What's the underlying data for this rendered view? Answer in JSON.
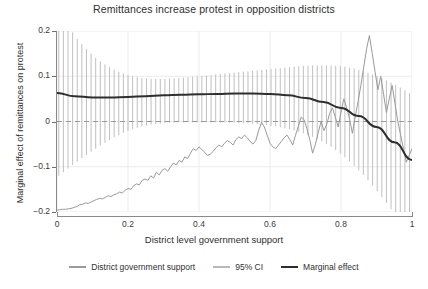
{
  "chart_data": {
    "type": "line",
    "title": "Remittances increase protest in opposition districts",
    "xlabel": "District level government support",
    "ylabel": "Marginal effect of remittances on protest",
    "xlim": [
      0,
      1
    ],
    "ylim": [
      -0.2,
      0.2
    ],
    "xticks": [
      "0",
      "0.2",
      "0.4",
      "0.6",
      "0.8",
      "1"
    ],
    "xtick_values": [
      0,
      0.2,
      0.4,
      0.6,
      0.8,
      1
    ],
    "yticks": [
      "0.2",
      "0.1",
      "0",
      "-0.1",
      "-0.2"
    ],
    "ytick_values": [
      0.2,
      0.1,
      0,
      -0.1,
      -0.2
    ],
    "grid": true,
    "legend_position": "bottom",
    "zero_reference_line": 0,
    "colors": {
      "support_line": "#9a9a9a",
      "ci_bars": "#b9b9b9",
      "marginal_effect": "#2e2e2e",
      "grid": "#ebebeb",
      "zero_line": "#9a9a9a",
      "axis": "#8a8a8a",
      "text": "#2f2f2f",
      "background": "#ffffff"
    },
    "series": [
      {
        "name": "Marginal effect",
        "style": "solid-thick-dark",
        "x": [
          0.0,
          0.05,
          0.1,
          0.15,
          0.2,
          0.25,
          0.3,
          0.35,
          0.4,
          0.45,
          0.5,
          0.55,
          0.6,
          0.65,
          0.7,
          0.75,
          0.8,
          0.85,
          0.9,
          0.95,
          1.0
        ],
        "values": [
          0.063,
          0.056,
          0.053,
          0.053,
          0.054,
          0.056,
          0.058,
          0.059,
          0.06,
          0.061,
          0.062,
          0.062,
          0.061,
          0.058,
          0.052,
          0.043,
          0.03,
          0.012,
          -0.012,
          -0.046,
          -0.085
        ]
      },
      {
        "name": "95% CI",
        "style": "vertical-bars",
        "x": [
          0.005,
          0.018,
          0.031,
          0.044,
          0.057,
          0.07,
          0.083,
          0.096,
          0.109,
          0.122,
          0.135,
          0.148,
          0.161,
          0.174,
          0.187,
          0.2,
          0.213,
          0.226,
          0.239,
          0.252,
          0.265,
          0.278,
          0.291,
          0.304,
          0.317,
          0.33,
          0.343,
          0.356,
          0.369,
          0.382,
          0.395,
          0.408,
          0.421,
          0.434,
          0.447,
          0.46,
          0.473,
          0.486,
          0.499,
          0.512,
          0.525,
          0.538,
          0.551,
          0.564,
          0.577,
          0.59,
          0.603,
          0.616,
          0.629,
          0.642,
          0.655,
          0.668,
          0.681,
          0.694,
          0.707,
          0.72,
          0.733,
          0.746,
          0.759,
          0.772,
          0.785,
          0.798,
          0.811,
          0.824,
          0.837,
          0.85,
          0.863,
          0.876,
          0.889,
          0.902,
          0.915,
          0.928,
          0.941,
          0.954,
          0.967,
          0.98,
          0.993
        ],
        "lower": [
          -0.12,
          -0.112,
          -0.104,
          -0.096,
          -0.089,
          -0.081,
          -0.074,
          -0.067,
          -0.06,
          -0.053,
          -0.047,
          -0.041,
          -0.035,
          -0.03,
          -0.025,
          -0.021,
          -0.017,
          -0.014,
          -0.011,
          -0.009,
          -0.007,
          -0.006,
          -0.005,
          -0.004,
          -0.003,
          -0.003,
          -0.002,
          -0.002,
          -0.002,
          -0.002,
          -0.002,
          -0.002,
          -0.002,
          -0.002,
          -0.002,
          -0.002,
          -0.002,
          -0.002,
          -0.003,
          -0.003,
          -0.004,
          -0.004,
          -0.005,
          -0.006,
          -0.007,
          -0.008,
          -0.01,
          -0.011,
          -0.013,
          -0.015,
          -0.017,
          -0.02,
          -0.023,
          -0.026,
          -0.03,
          -0.034,
          -0.039,
          -0.044,
          -0.05,
          -0.056,
          -0.063,
          -0.071,
          -0.079,
          -0.088,
          -0.098,
          -0.108,
          -0.118,
          -0.13,
          -0.142,
          -0.154,
          -0.167,
          -0.18,
          -0.194,
          -0.208,
          -0.222,
          -0.237,
          -0.252
        ],
        "upper": [
          0.246,
          0.228,
          0.212,
          0.197,
          0.183,
          0.171,
          0.16,
          0.15,
          0.141,
          0.133,
          0.126,
          0.12,
          0.115,
          0.11,
          0.106,
          0.103,
          0.1,
          0.098,
          0.096,
          0.095,
          0.094,
          0.094,
          0.094,
          0.094,
          0.095,
          0.095,
          0.096,
          0.097,
          0.098,
          0.099,
          0.1,
          0.101,
          0.102,
          0.103,
          0.104,
          0.105,
          0.106,
          0.107,
          0.108,
          0.109,
          0.11,
          0.111,
          0.112,
          0.113,
          0.114,
          0.115,
          0.116,
          0.117,
          0.118,
          0.119,
          0.12,
          0.121,
          0.122,
          0.123,
          0.123,
          0.124,
          0.124,
          0.124,
          0.124,
          0.124,
          0.123,
          0.122,
          0.121,
          0.119,
          0.117,
          0.114,
          0.111,
          0.108,
          0.104,
          0.1,
          0.096,
          0.091,
          0.086,
          0.081,
          0.075,
          0.069,
          0.063
        ]
      },
      {
        "name": "District government support",
        "style": "solid-thin-gray",
        "x": [
          0.0,
          0.008,
          0.016,
          0.024,
          0.032,
          0.04,
          0.048,
          0.056,
          0.064,
          0.072,
          0.08,
          0.088,
          0.096,
          0.104,
          0.112,
          0.12,
          0.128,
          0.136,
          0.144,
          0.152,
          0.16,
          0.168,
          0.176,
          0.184,
          0.192,
          0.2,
          0.208,
          0.216,
          0.224,
          0.232,
          0.24,
          0.248,
          0.256,
          0.264,
          0.272,
          0.28,
          0.288,
          0.296,
          0.304,
          0.312,
          0.32,
          0.328,
          0.336,
          0.344,
          0.352,
          0.36,
          0.368,
          0.376,
          0.384,
          0.392,
          0.4,
          0.408,
          0.416,
          0.424,
          0.432,
          0.44,
          0.448,
          0.456,
          0.464,
          0.472,
          0.48,
          0.488,
          0.496,
          0.504,
          0.512,
          0.52,
          0.528,
          0.536,
          0.544,
          0.552,
          0.56,
          0.568,
          0.576,
          0.584,
          0.592,
          0.6,
          0.608,
          0.616,
          0.624,
          0.632,
          0.64,
          0.648,
          0.656,
          0.664,
          0.672,
          0.68,
          0.688,
          0.696,
          0.704,
          0.712,
          0.72,
          0.728,
          0.736,
          0.744,
          0.752,
          0.76,
          0.768,
          0.776,
          0.784,
          0.792,
          0.8,
          0.808,
          0.816,
          0.824,
          0.832,
          0.84,
          0.848,
          0.856,
          0.864,
          0.872,
          0.88,
          0.888,
          0.896,
          0.904,
          0.912,
          0.92,
          0.928,
          0.936,
          0.944,
          0.952,
          0.96,
          0.968,
          0.976,
          0.984,
          0.992,
          1.0
        ],
        "values": [
          -0.196,
          -0.195,
          -0.194,
          -0.194,
          -0.193,
          -0.192,
          -0.19,
          -0.188,
          -0.184,
          -0.183,
          -0.18,
          -0.181,
          -0.178,
          -0.175,
          -0.172,
          -0.17,
          -0.171,
          -0.168,
          -0.164,
          -0.166,
          -0.162,
          -0.16,
          -0.156,
          -0.158,
          -0.152,
          -0.148,
          -0.15,
          -0.142,
          -0.138,
          -0.14,
          -0.13,
          -0.127,
          -0.13,
          -0.12,
          -0.125,
          -0.112,
          -0.118,
          -0.108,
          -0.104,
          -0.11,
          -0.1,
          -0.092,
          -0.096,
          -0.086,
          -0.09,
          -0.078,
          -0.082,
          -0.07,
          -0.06,
          -0.064,
          -0.056,
          -0.062,
          -0.068,
          -0.075,
          -0.072,
          -0.066,
          -0.058,
          -0.052,
          -0.056,
          -0.048,
          -0.042,
          -0.046,
          -0.052,
          -0.04,
          -0.034,
          -0.038,
          -0.03,
          -0.036,
          -0.044,
          -0.05,
          -0.042,
          -0.02,
          -0.002,
          -0.012,
          -0.03,
          -0.048,
          -0.056,
          -0.06,
          -0.052,
          -0.044,
          -0.036,
          -0.03,
          -0.04,
          -0.052,
          -0.03,
          -0.01,
          0.01,
          0.004,
          -0.016,
          -0.04,
          -0.07,
          -0.05,
          -0.024,
          0.0,
          -0.02,
          -0.006,
          0.018,
          0.03,
          0.01,
          -0.012,
          0.02,
          0.05,
          0.03,
          0.006,
          -0.026,
          0.01,
          0.044,
          0.08,
          0.12,
          0.16,
          0.19,
          0.15,
          0.11,
          0.07,
          0.1,
          0.06,
          0.02,
          0.05,
          0.08,
          0.04,
          0.0,
          -0.03,
          -0.06,
          -0.09,
          -0.075,
          -0.06
        ]
      }
    ],
    "legend": [
      {
        "label": "District government support",
        "swatch": "support"
      },
      {
        "label": "95% CI",
        "swatch": "ci"
      },
      {
        "label": "Marginal effect",
        "swatch": "marginal"
      }
    ]
  }
}
